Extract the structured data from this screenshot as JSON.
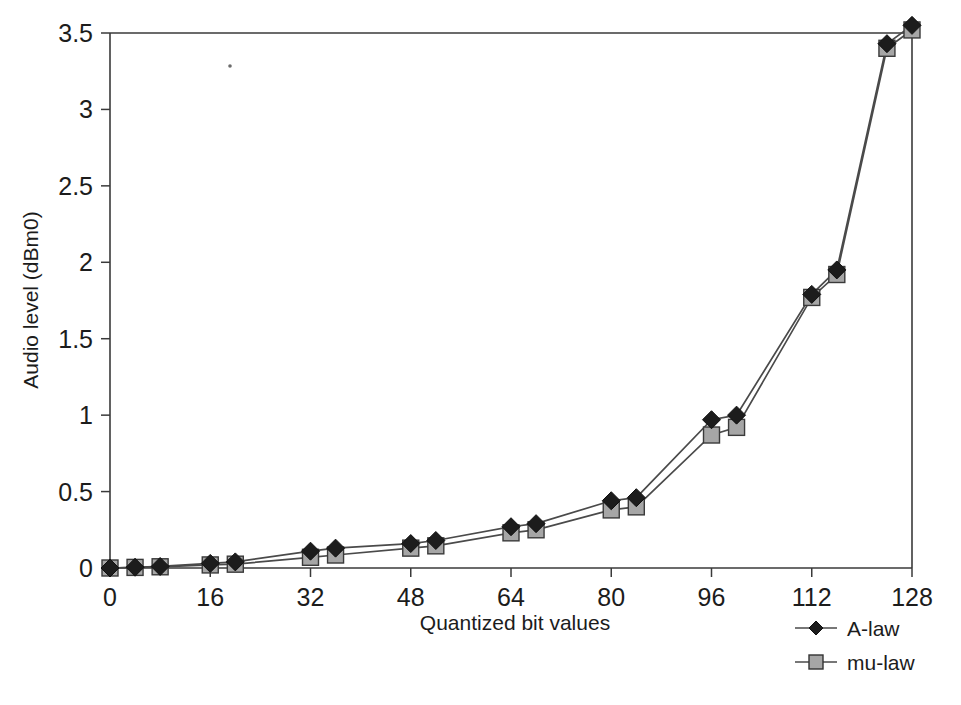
{
  "chart_data": {
    "type": "line",
    "title": "",
    "xlabel": "Quantized bit values",
    "ylabel": "Audio level (dBm0)",
    "xlim": [
      0,
      128
    ],
    "ylim": [
      0,
      3.5
    ],
    "xticks": [
      0,
      16,
      32,
      48,
      64,
      80,
      96,
      112,
      128
    ],
    "xtick_labels": [
      "0",
      "16",
      "32",
      "48",
      "64",
      "80",
      "96",
      "112",
      "128"
    ],
    "yticks": [
      0,
      0.5,
      1,
      1.5,
      2,
      2.5,
      3,
      3.5
    ],
    "ytick_labels": [
      "0",
      "0.5",
      "1",
      "1.5",
      "2",
      "2.5",
      "3",
      "3.5"
    ],
    "grid": false,
    "legend_position": "bottom-right",
    "x": [
      0,
      4,
      8,
      16,
      20,
      32,
      36,
      48,
      52,
      64,
      68,
      80,
      84,
      96,
      100,
      112,
      116,
      124,
      128
    ],
    "series": [
      {
        "name": "A-law",
        "marker": "diamond",
        "marker_color": "#1c1c1c",
        "line_color": "#4a4a4a",
        "values": [
          0,
          0.005,
          0.01,
          0.03,
          0.04,
          0.11,
          0.13,
          0.16,
          0.18,
          0.27,
          0.29,
          0.44,
          0.46,
          0.97,
          1.0,
          1.79,
          1.95,
          3.43,
          3.55
        ]
      },
      {
        "name": "mu-law",
        "marker": "square",
        "marker_color": "#a6a6a6",
        "line_color": "#4a4a4a",
        "values": [
          0,
          0.004,
          0.008,
          0.02,
          0.025,
          0.07,
          0.085,
          0.13,
          0.145,
          0.23,
          0.25,
          0.38,
          0.4,
          0.87,
          0.92,
          1.77,
          1.92,
          3.4,
          3.52
        ]
      }
    ]
  },
  "legend": {
    "items": [
      {
        "label": "A-law",
        "marker": "diamond"
      },
      {
        "label": "mu-law",
        "marker": "square"
      }
    ]
  },
  "axes": {
    "x_title": "Quantized bit values",
    "y_title": "Audio level (dBm0)"
  }
}
